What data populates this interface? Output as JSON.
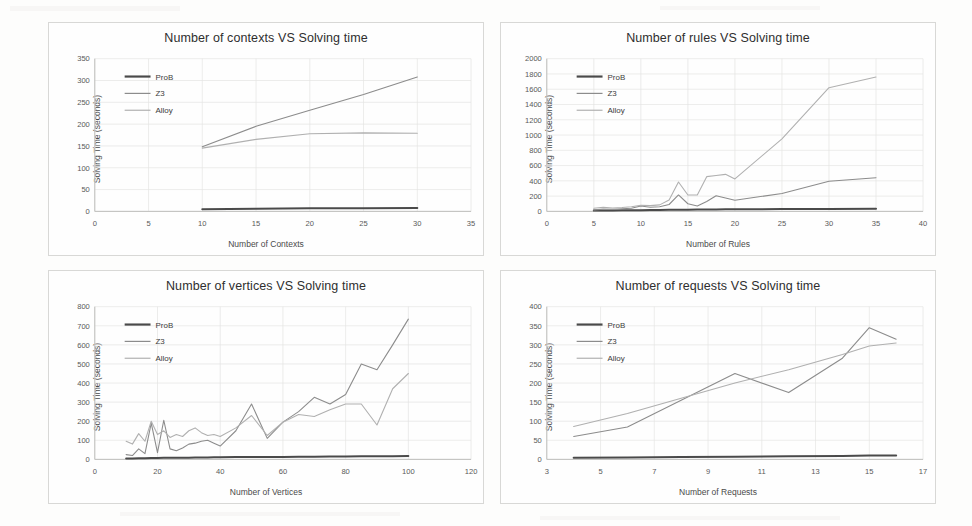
{
  "page": {
    "background": "#fdfdfc",
    "panel_border": "#d8d8d6"
  },
  "series_colors": {
    "ProB": "#4a4a4a",
    "Z3": "#8c8c8c",
    "Alloy": "#b0b0b0"
  },
  "charts": [
    {
      "id": "contexts",
      "title": "Number of contexts VS Solving time",
      "xlabel": "Number of Contexts",
      "ylabel": "Solving Time (seconds)",
      "xticks": [
        0,
        5,
        10,
        15,
        20,
        25,
        30,
        35
      ],
      "yticks": [
        0,
        50,
        100,
        150,
        200,
        250,
        300,
        350
      ],
      "xlim": [
        0,
        35
      ],
      "ylim": [
        0,
        350
      ],
      "legend": [
        "ProB",
        "Z3",
        "Alloy"
      ],
      "chart_data": {
        "type": "line",
        "title": "Number of contexts VS Solving time",
        "xlabel": "Number of Contexts",
        "ylabel": "Solving Time (seconds)",
        "xlim": [
          0,
          35
        ],
        "ylim": [
          0,
          350
        ],
        "grid": true,
        "legend_position": "inside-upper-left",
        "x": [
          10,
          15,
          20,
          25,
          30
        ],
        "series": [
          {
            "name": "ProB",
            "values": [
              5,
              6,
              7,
              7,
              8
            ]
          },
          {
            "name": "Z3",
            "values": [
              148,
              195,
              232,
              268,
              308
            ]
          },
          {
            "name": "Alloy",
            "values": [
              145,
              165,
              178,
              180,
              179
            ]
          }
        ]
      }
    },
    {
      "id": "rules",
      "title": "Number of rules VS Solving time",
      "xlabel": "Number of Rules",
      "ylabel": "Solving Time (seconds)",
      "xticks": [
        0,
        5,
        10,
        15,
        20,
        25,
        30,
        35,
        40
      ],
      "yticks": [
        0,
        200,
        400,
        600,
        800,
        1000,
        1200,
        1400,
        1600,
        1800,
        2000
      ],
      "xlim": [
        0,
        40
      ],
      "ylim": [
        0,
        2000
      ],
      "legend": [
        "ProB",
        "Z3",
        "Alloy"
      ],
      "chart_data": {
        "type": "line",
        "title": "Number of rules VS Solving time",
        "xlabel": "Number of Rules",
        "ylabel": "Solving Time (seconds)",
        "xlim": [
          0,
          40
        ],
        "ylim": [
          0,
          2000
        ],
        "grid": true,
        "legend_position": "inside-upper-left",
        "x": [
          5,
          6,
          7,
          8,
          9,
          10,
          11,
          12,
          13,
          14,
          15,
          16,
          17,
          18,
          19,
          20,
          25,
          30,
          35
        ],
        "series": [
          {
            "name": "ProB",
            "values": [
              10,
              12,
              12,
              14,
              15,
              16,
              18,
              18,
              20,
              22,
              22,
              24,
              25,
              26,
              28,
              28,
              30,
              32,
              34
            ]
          },
          {
            "name": "Z3",
            "values": [
              20,
              30,
              28,
              35,
              40,
              70,
              55,
              60,
              90,
              215,
              100,
              70,
              130,
              205,
              175,
              145,
              235,
              395,
              440
            ]
          },
          {
            "name": "Alloy",
            "values": [
              40,
              55,
              45,
              50,
              60,
              80,
              75,
              85,
              150,
              385,
              215,
              215,
              455,
              470,
              485,
              425,
              950,
              1620,
              1760
            ]
          }
        ]
      }
    },
    {
      "id": "vertices",
      "title": "Number of vertices VS Solving time",
      "xlabel": "Number of Vertices",
      "ylabel": "Solving Time (seconds)",
      "xticks": [
        0,
        20,
        40,
        60,
        80,
        100,
        120
      ],
      "yticks": [
        0,
        100,
        200,
        300,
        400,
        500,
        600,
        700,
        800
      ],
      "xlim": [
        0,
        120
      ],
      "ylim": [
        0,
        800
      ],
      "legend": [
        "ProB",
        "Z3",
        "Alloy"
      ],
      "chart_data": {
        "type": "line",
        "title": "Number of vertices VS Solving time",
        "xlabel": "Number of Vertices",
        "ylabel": "Solving Time (seconds)",
        "xlim": [
          0,
          120
        ],
        "ylim": [
          0,
          800
        ],
        "grid": true,
        "legend_position": "inside-upper-left",
        "x": [
          10,
          12,
          14,
          16,
          18,
          20,
          22,
          24,
          26,
          28,
          30,
          32,
          34,
          36,
          38,
          40,
          45,
          50,
          55,
          60,
          65,
          70,
          75,
          80,
          85,
          90,
          95,
          100
        ],
        "series": [
          {
            "name": "ProB",
            "values": [
              5,
              5,
              6,
              6,
              7,
              7,
              8,
              8,
              8,
              9,
              9,
              10,
              10,
              10,
              11,
              11,
              12,
              12,
              13,
              13,
              14,
              14,
              15,
              15,
              16,
              16,
              17,
              18
            ]
          },
          {
            "name": "Z3",
            "values": [
              25,
              20,
              55,
              30,
              190,
              35,
              205,
              55,
              45,
              60,
              80,
              85,
              95,
              100,
              85,
              70,
              150,
              290,
              110,
              195,
              250,
              325,
              290,
              340,
              500,
              470,
              600,
              735
            ]
          },
          {
            "name": "Alloy",
            "values": [
              95,
              80,
              135,
              95,
              200,
              130,
              150,
              115,
              130,
              120,
              150,
              165,
              140,
              125,
              130,
              120,
              165,
              230,
              125,
              195,
              235,
              225,
              260,
              290,
              290,
              180,
              370,
              450
            ]
          }
        ]
      }
    },
    {
      "id": "requests",
      "title": "Number of requests VS Solving time",
      "xlabel": "Number of Requests",
      "ylabel": "Solving Time (seconds)",
      "xticks": [
        3,
        5,
        7,
        9,
        11,
        13,
        15,
        17
      ],
      "yticks": [
        0,
        50,
        100,
        150,
        200,
        250,
        300,
        350,
        400
      ],
      "xlim": [
        3,
        17
      ],
      "ylim": [
        0,
        400
      ],
      "legend": [
        "ProB",
        "Z3",
        "Alloy"
      ],
      "chart_data": {
        "type": "line",
        "title": "Number of requests VS Solving time",
        "xlabel": "Number of Requests",
        "ylabel": "Solving Time (seconds)",
        "xlim": [
          3,
          17
        ],
        "ylim": [
          0,
          400
        ],
        "grid": true,
        "legend_position": "inside-upper-left",
        "x": [
          4,
          6,
          8,
          10,
          12,
          14,
          15,
          16
        ],
        "series": [
          {
            "name": "ProB",
            "values": [
              4,
              5,
              6,
              7,
              8,
              9,
              10,
              10
            ]
          },
          {
            "name": "Z3",
            "values": [
              60,
              85,
              155,
              225,
              175,
              265,
              345,
              315
            ]
          },
          {
            "name": "Alloy",
            "values": [
              86,
              120,
              160,
              200,
              235,
              275,
              297,
              305
            ]
          }
        ]
      }
    }
  ]
}
